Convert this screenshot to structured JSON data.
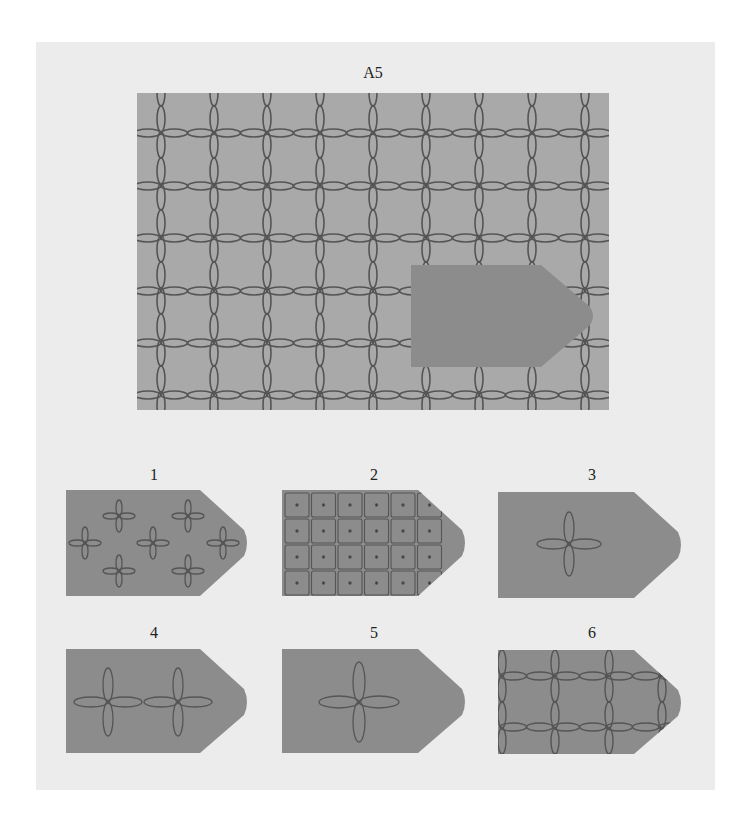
{
  "puzzle": {
    "title": "A5",
    "colors": {
      "page_background": "#ffffff",
      "panel_background": "#ececec",
      "grid_background": "#a9a9a9",
      "tag_fill": "#8c8c8c",
      "stroke": "#555555"
    },
    "main_figure": {
      "label": "A5",
      "pattern": "grid of chained ellipse links (vertical lines spaced ~53px, horizontal lines ~52px), each intersection forms a four-petal flower",
      "missing_piece": "tag-shaped blank region (pentagon with rounded point) in lower right"
    },
    "options": [
      {
        "id": 1,
        "label": "1",
        "description": "seven small four-petal flowers scattered"
      },
      {
        "id": 2,
        "label": "2",
        "description": "dense small grid of squares with center dots"
      },
      {
        "id": 3,
        "label": "3",
        "description": "single four-petal flower, left-center"
      },
      {
        "id": 4,
        "label": "4",
        "description": "two four-petal flowers joined horizontally"
      },
      {
        "id": 5,
        "label": "5",
        "description": "single larger four-petal flower, center"
      },
      {
        "id": 6,
        "label": "6",
        "description": "chained ellipse grid matching main pattern"
      }
    ]
  }
}
